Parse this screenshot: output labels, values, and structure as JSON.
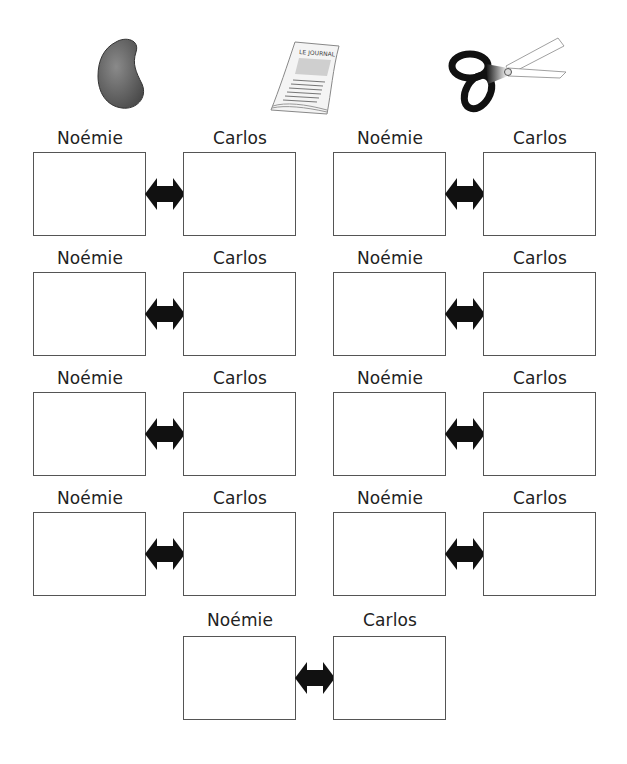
{
  "header_icons": [
    {
      "name": "bean-icon",
      "label": "bean"
    },
    {
      "name": "newspaper-icon",
      "label": "LE JOURNAL"
    },
    {
      "name": "scissors-icon",
      "label": "scissors"
    }
  ],
  "pairs": [
    {
      "left": "Noémie",
      "right": "Carlos"
    },
    {
      "left": "Noémie",
      "right": "Carlos"
    },
    {
      "left": "Noémie",
      "right": "Carlos"
    },
    {
      "left": "Noémie",
      "right": "Carlos"
    },
    {
      "left": "Noémie",
      "right": "Carlos"
    },
    {
      "left": "Noémie",
      "right": "Carlos"
    },
    {
      "left": "Noémie",
      "right": "Carlos"
    },
    {
      "left": "Noémie",
      "right": "Carlos"
    },
    {
      "left": "Noémie",
      "right": "Carlos"
    }
  ],
  "colors": {
    "border": "#555555",
    "arrow": "#111111"
  }
}
